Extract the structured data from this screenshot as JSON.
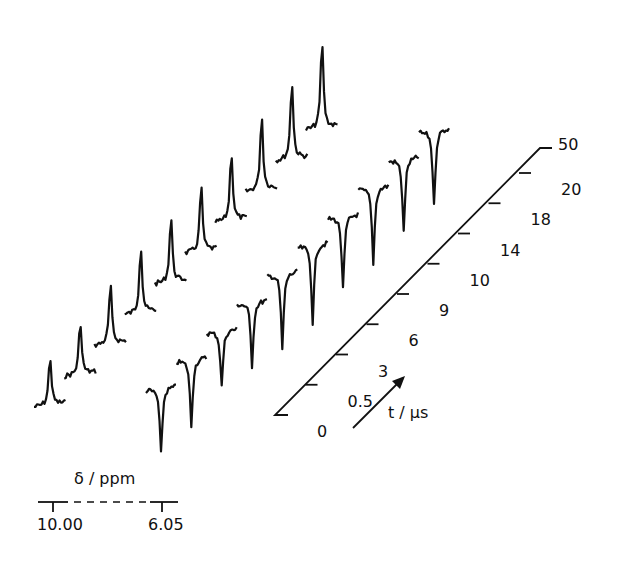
{
  "chart_data": {
    "type": "line",
    "title": "",
    "xlabel": "δ / ppm",
    "x_ticks": [
      "10.00",
      "6.05"
    ],
    "zlabel": "t / µs",
    "z_ticks": [
      "0",
      "0.5",
      "3",
      "6",
      "9",
      "10",
      "14",
      "18",
      "20",
      "50"
    ],
    "series": [
      {
        "name": "δ 10.00 signal (positive)",
        "peak_ppm": 10.0,
        "t_us": [
          0,
          0.5,
          3,
          6,
          9,
          10,
          14,
          18,
          20,
          50
        ],
        "relative_intensity": [
          0.62,
          0.68,
          0.76,
          0.86,
          0.84,
          0.84,
          0.88,
          0.96,
          1.0,
          1.12
        ]
      },
      {
        "name": "δ 6.05 signal (negative)",
        "peak_ppm": 6.05,
        "t_us": [
          0,
          0.5,
          3,
          6,
          9,
          10,
          14,
          18,
          20,
          50
        ],
        "relative_intensity": [
          -0.82,
          -0.84,
          -0.7,
          -0.8,
          -0.95,
          -0.98,
          -0.92,
          -0.95,
          -0.92,
          -0.95
        ]
      }
    ]
  },
  "labels": {
    "x_axis": "δ / ppm",
    "x_tick_left": "10.00",
    "x_tick_right": "6.05",
    "t_axis": "t / µs",
    "t_ticks": [
      "0",
      "0.5",
      "3",
      "6",
      "9",
      "10",
      "14",
      "18",
      "20",
      "50"
    ]
  }
}
